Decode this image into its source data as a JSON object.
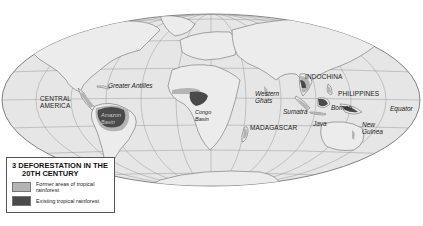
{
  "map": {
    "projection": "Mollweide",
    "colors": {
      "ocean": "#e8e8e8",
      "land_outline": "#777777",
      "graticule": "#999999",
      "former_rainforest": "#b4b4b4",
      "existing_rainforest": "#4a4a4a"
    },
    "labels": {
      "central_america_1": "CENTRAL",
      "central_america_2": "AMERICA",
      "greater_antilles": "Greater Antilles",
      "amazon_1": "Amazon",
      "amazon_2": "Basin",
      "congo_1": "Congo",
      "congo_2": "Basin",
      "western_ghats_1": "Western",
      "western_ghats_2": "Ghats",
      "madagascar": "MADAGASCAR",
      "indochina": "INDOCHINA",
      "philippines": "PHILIPPINES",
      "sumatra": "Sumatra",
      "borneo": "Borneo",
      "java": "Java",
      "new_guinea_1": "New",
      "new_guinea_2": "Guinea",
      "equator": "Equator"
    }
  },
  "legend": {
    "title_line1": "3 DEFORESTATION IN THE",
    "title_line2": "20TH CENTURY",
    "items": [
      {
        "label": "Former areas of tropical rainforest",
        "color": "#b4b4b4"
      },
      {
        "label": "Existing tropical rainforest",
        "color": "#4a4a4a"
      }
    ]
  }
}
